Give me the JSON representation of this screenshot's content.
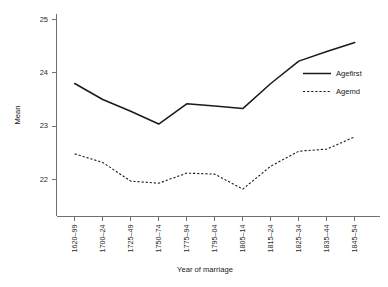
{
  "chart_data": {
    "type": "line",
    "title": "",
    "xlabel": "Year of marriage",
    "ylabel": "Mean",
    "categories": [
      "1620–99",
      "1700–24",
      "1725–49",
      "1750–74",
      "1775–94",
      "1795–04",
      "1805–14",
      "1815–24",
      "1825–34",
      "1835–44",
      "1845–54"
    ],
    "series": [
      {
        "name": "Agefirst",
        "style": "solid",
        "color": "#1a1a1a",
        "values": [
          23.8,
          23.5,
          23.28,
          23.04,
          23.42,
          23.38,
          23.33,
          23.8,
          24.22,
          24.4,
          24.57
        ]
      },
      {
        "name": "Agemd",
        "style": "dashed",
        "color": "#1a1a1a",
        "values": [
          22.48,
          22.32,
          21.97,
          21.93,
          22.12,
          22.1,
          21.82,
          22.25,
          22.53,
          22.57,
          22.8
        ]
      }
    ],
    "yticks": [
      22,
      23,
      24,
      25
    ],
    "ytick_labels": [
      "22",
      "23",
      "24",
      "25"
    ],
    "ylim": [
      21.45,
      25.15
    ],
    "xlim": [
      -0.45,
      10.45
    ],
    "grid": false,
    "legend_position": "right-inside-top",
    "legend_entries": [
      {
        "label": "Agefirst",
        "style": "solid"
      },
      {
        "label": "Agemd",
        "style": "dashed"
      }
    ]
  }
}
